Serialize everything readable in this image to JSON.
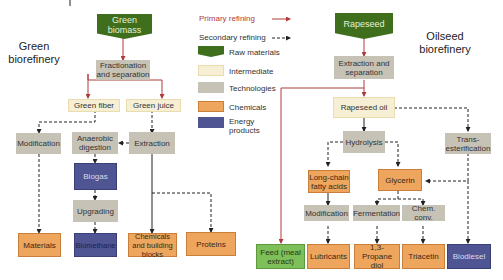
{
  "titles": {
    "green": "Green biorefinery",
    "oilseed": "Oilseed biorefinery"
  },
  "legend": {
    "primary": "Primary refining",
    "secondary": "Secondary refining",
    "raw": "Raw materials",
    "intermediate": "Intermediate",
    "technologies": "Technologies",
    "chemicals": "Chemicals",
    "energy": "Energy products"
  },
  "colors": {
    "raw": "#3f6e1d",
    "intermediate": "#f6efd3",
    "technologies": "#c7c2b6",
    "chemicals": "#eea55d",
    "energy": "#4e5592",
    "feed": "#7fbf5a",
    "primary_arrow": "#b03a3a",
    "secondary_arrow": "#333333"
  },
  "green": {
    "raw": "Green biomass",
    "fractionation": "Fractionation and separation",
    "fiber": "Green fiber",
    "juice": "Green juice",
    "modification": "Modification",
    "anaerobic": "Anaerobic digestion",
    "extraction": "Extraction",
    "biogas": "Biogas",
    "upgrading": "Upgrading",
    "materials": "Materials",
    "biomethane": "Biomethane",
    "chemicals": "Chemicals and building blocks",
    "proteins": "Proteins"
  },
  "oilseed": {
    "raw": "Rapeseed",
    "extraction": "Extraction and separation",
    "oil": "Rapeseed oil",
    "hydrolysis": "Hydrolysis",
    "trans": "Trans-esterification",
    "fatty": "Long-chain fatty acids",
    "glycerin": "Glycerin",
    "modification": "Modification",
    "fermentation": "Fermentation",
    "chemconv": "Chem. conv.",
    "feed": "Feed (meal extract)",
    "lubricants": "Lubricants",
    "propanediol": "1,3-Propane diol",
    "triacetin": "Triacetin",
    "biodiesel": "Biodiesel"
  }
}
